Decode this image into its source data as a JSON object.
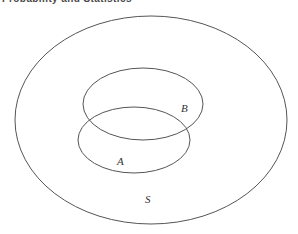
{
  "page": {
    "width": 298,
    "height": 234,
    "background_color": "#ffffff"
  },
  "header": {
    "title": "Probability and Statistics"
  },
  "diagram": {
    "type": "venn-diagram",
    "stroke_color": "#555555",
    "label_color": "#333333",
    "sets": [
      {
        "id": "universe",
        "label": "S",
        "shape": "ellipse",
        "cx": 151,
        "cy": 120,
        "rx": 136,
        "ry": 104,
        "label_x": 145,
        "label_y": 203
      },
      {
        "id": "set-b",
        "label": "B",
        "shape": "ellipse",
        "cx": 143,
        "cy": 104,
        "rx": 60,
        "ry": 36,
        "label_x": 181,
        "label_y": 112
      },
      {
        "id": "set-a",
        "label": "A",
        "shape": "ellipse",
        "cx": 134,
        "cy": 140,
        "rx": 56,
        "ry": 33,
        "label_x": 117,
        "label_y": 165
      }
    ]
  }
}
